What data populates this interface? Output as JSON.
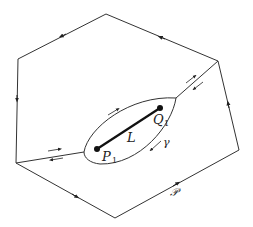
{
  "diagram": {
    "labels": {
      "segment": "L",
      "start_point": "P",
      "start_sub": "1",
      "end_point": "Q",
      "end_sub": "1",
      "contour": "γ",
      "region": "𝒫"
    },
    "colors": {
      "line": "#333333",
      "segment": "#111111",
      "background": "#ffffff"
    }
  }
}
